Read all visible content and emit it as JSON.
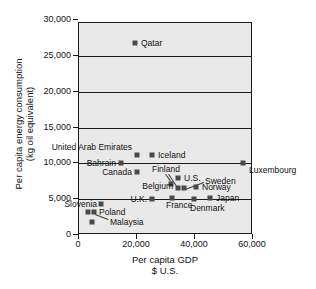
{
  "chart_data": {
    "type": "scatter",
    "title": "",
    "xlabel": "Per capita GDP",
    "xlabel_line2": "$ U.S.",
    "ylabel": "Per capita energy consumption",
    "ylabel_line2": "(kg oil equivalent)",
    "xlim": [
      0,
      70000
    ],
    "ylim": [
      0,
      30000
    ],
    "xticks": [
      "0",
      "20,000",
      "40,000",
      "60,000"
    ],
    "xtick_values": [
      0,
      20000,
      40000,
      60000
    ],
    "yticks": [
      "0",
      "5,000",
      "10,000",
      "15,000",
      "20,000",
      "25,000",
      "30,000"
    ],
    "ytick_values": [
      0,
      5000,
      10000,
      15000,
      20000,
      25000,
      30000
    ],
    "grid": "horizontal",
    "legend": "none",
    "marker_color": "#4a4a4a",
    "plot_background": "#e9e9e9",
    "axis_color": "#1a1a1a",
    "points": [
      {
        "label": "Qatar",
        "x": 70000,
        "y": 26500,
        "px": 135,
        "py": 43,
        "lx": 141,
        "ly": 43,
        "align": "right"
      },
      {
        "label": "United Arab Emirates",
        "x": 20500,
        "y": 11300,
        "px": 137,
        "py": 155,
        "lx": 132,
        "ly": 147,
        "align": "left"
      },
      {
        "label": "Iceland",
        "x": 25500,
        "y": 11400,
        "px": 152,
        "py": 155,
        "lx": 158,
        "ly": 155,
        "align": "right"
      },
      {
        "label": "Bahrain",
        "x": 15000,
        "y": 9400,
        "px": 121,
        "py": 163,
        "lx": 116,
        "ly": 163,
        "align": "left"
      },
      {
        "label": "Luxembourg",
        "x": 57000,
        "y": 9800,
        "px": 243,
        "py": 163,
        "lx": 249,
        "ly": 170,
        "align": "right"
      },
      {
        "label": "Canada",
        "x": 20500,
        "y": 8000,
        "px": 137,
        "py": 172,
        "lx": 132,
        "ly": 172,
        "align": "left"
      },
      {
        "label": "Finland",
        "x": 32000,
        "y": 7000,
        "px": 171,
        "py": 184,
        "lx": 152,
        "ly": 169,
        "align": "right"
      },
      {
        "label": "U.S.",
        "x": 34500,
        "y": 7800,
        "px": 178,
        "py": 178,
        "lx": 184,
        "ly": 178,
        "align": "right"
      },
      {
        "label": "Belgium",
        "x": 34500,
        "y": 5500,
        "px": 178,
        "py": 188,
        "lx": 173,
        "ly": 186,
        "align": "left"
      },
      {
        "label": "Sweden",
        "x": 36500,
        "y": 5400,
        "px": 184,
        "py": 188,
        "lx": 205,
        "ly": 181,
        "align": "right"
      },
      {
        "label": "Norway",
        "x": 40500,
        "y": 5800,
        "px": 196,
        "py": 187,
        "lx": 202,
        "ly": 187,
        "align": "right"
      },
      {
        "label": "France",
        "x": 32000,
        "y": 4200,
        "px": 172,
        "py": 198,
        "lx": 166,
        "ly": 205,
        "align": "right"
      },
      {
        "label": "U.K.",
        "x": 25500,
        "y": 3800,
        "px": 152,
        "py": 199,
        "lx": 147,
        "ly": 199,
        "align": "left"
      },
      {
        "label": "Denmark",
        "x": 40000,
        "y": 3700,
        "px": 194,
        "py": 199,
        "lx": 190,
        "ly": 208,
        "align": "right"
      },
      {
        "label": "Japan",
        "x": 45500,
        "y": 4000,
        "px": 210,
        "py": 198,
        "lx": 216,
        "ly": 198,
        "align": "right"
      },
      {
        "label": "Slovenia",
        "x": 8000,
        "y": 3500,
        "px": 101,
        "py": 204,
        "lx": 97,
        "ly": 204,
        "align": "left"
      },
      {
        "label": "Poland",
        "x": 5500,
        "y": 2200,
        "px": 94,
        "py": 212,
        "lx": 99,
        "ly": 212,
        "align": "right"
      },
      {
        "label": "",
        "x": 3500,
        "y": 2200,
        "px": 88,
        "py": 212,
        "lx": 0,
        "ly": 0,
        "align": "none"
      },
      {
        "label": "Malaysia",
        "x": 4500,
        "y": 900,
        "px": 92,
        "py": 222,
        "lx": 110,
        "ly": 222,
        "align": "right"
      }
    ],
    "leader_lines": [
      {
        "from_label": "Finland",
        "x1": 166,
        "y1": 174,
        "x2": 171,
        "y2": 181
      },
      {
        "from_label": "Finland2",
        "x1": 169,
        "y1": 174,
        "x2": 177,
        "y2": 186
      },
      {
        "from_label": "Sweden",
        "x1": 204,
        "y1": 183,
        "x2": 185,
        "y2": 190
      },
      {
        "from_label": "Malaysia",
        "x1": 108,
        "y1": 220,
        "x2": 95,
        "y2": 215
      }
    ]
  }
}
